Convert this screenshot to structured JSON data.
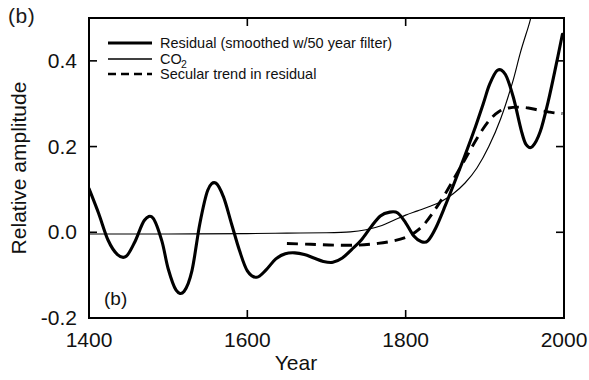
{
  "figure": {
    "panel_label_outer": "(b)",
    "panel_label_inner": "(b)"
  },
  "legend": {
    "position": "top-left-inside",
    "entries": [
      {
        "label": "Residual (smoothed w/50 year filter)",
        "style": "thick-solid",
        "name": "residual"
      },
      {
        "label": "CO",
        "sublabel": "2",
        "style": "thin-solid",
        "name": "co2"
      },
      {
        "label": "Secular trend in residual",
        "style": "dashed",
        "name": "secular-trend"
      }
    ]
  },
  "chart_data": {
    "type": "line",
    "title": "",
    "xlabel": "Year",
    "ylabel": "Relative amplitude",
    "xlim": [
      1400,
      2000
    ],
    "ylim": [
      -0.2,
      0.5
    ],
    "yaxis_display_range": [
      -0.2,
      0.5
    ],
    "xticks": [
      1400,
      1600,
      1800,
      2000
    ],
    "xtick_labels": [
      "1400",
      "1600",
      "1800",
      "2000"
    ],
    "yticks": [
      -0.2,
      0.0,
      0.2,
      0.4
    ],
    "ytick_labels": [
      "-0.2",
      "0.0",
      "0.2",
      "0.4"
    ],
    "grid": false,
    "legend_position": "upper left",
    "series": [
      {
        "name": "Residual (smoothed w/50 year filter)",
        "style": "thick-solid",
        "x": [
          1400,
          1412,
          1424,
          1436,
          1447,
          1458,
          1470,
          1481,
          1492,
          1500,
          1510,
          1520,
          1530,
          1540,
          1550,
          1560,
          1570,
          1580,
          1590,
          1600,
          1612,
          1624,
          1636,
          1648,
          1660,
          1672,
          1684,
          1696,
          1708,
          1720,
          1732,
          1744,
          1756,
          1768,
          1780,
          1790,
          1800,
          1810,
          1820,
          1828,
          1838,
          1850,
          1862,
          1874,
          1886,
          1898,
          1906,
          1916,
          1926,
          1936,
          1946,
          1952,
          1960,
          1970,
          1980,
          1990,
          1998
        ],
        "y": [
          0.102,
          0.045,
          -0.018,
          -0.052,
          -0.056,
          -0.022,
          0.028,
          0.033,
          -0.02,
          -0.085,
          -0.135,
          -0.138,
          -0.09,
          0.02,
          0.098,
          0.115,
          0.082,
          0.02,
          -0.042,
          -0.09,
          -0.105,
          -0.087,
          -0.062,
          -0.05,
          -0.048,
          -0.052,
          -0.06,
          -0.068,
          -0.07,
          -0.06,
          -0.04,
          -0.018,
          0.012,
          0.038,
          0.047,
          0.045,
          0.022,
          -0.008,
          -0.022,
          -0.02,
          0.01,
          0.062,
          0.118,
          0.175,
          0.235,
          0.3,
          0.345,
          0.378,
          0.368,
          0.315,
          0.238,
          0.205,
          0.2,
          0.235,
          0.305,
          0.39,
          0.462
        ]
      },
      {
        "name": "CO2",
        "style": "thin-solid",
        "x": [
          1400,
          1500,
          1600,
          1650,
          1700,
          1730,
          1750,
          1770,
          1785,
          1800,
          1815,
          1830,
          1845,
          1860,
          1875,
          1890,
          1905,
          1920,
          1935,
          1945,
          1955,
          1958
        ],
        "y": [
          -0.004,
          -0.004,
          -0.003,
          -0.002,
          -0.001,
          0.001,
          0.006,
          0.016,
          0.028,
          0.04,
          0.05,
          0.06,
          0.072,
          0.09,
          0.115,
          0.15,
          0.2,
          0.265,
          0.35,
          0.42,
          0.48,
          0.5
        ]
      },
      {
        "name": "Secular trend in residual",
        "style": "dashed",
        "x": [
          1650,
          1680,
          1710,
          1740,
          1765,
          1785,
          1800,
          1812,
          1824,
          1836,
          1850,
          1864,
          1878,
          1892,
          1906,
          1918,
          1930,
          1942,
          1955,
          1968,
          1980,
          1990,
          1998
        ],
        "y": [
          -0.026,
          -0.028,
          -0.03,
          -0.03,
          -0.026,
          -0.02,
          -0.012,
          0.0,
          0.02,
          0.05,
          0.09,
          0.135,
          0.18,
          0.225,
          0.262,
          0.282,
          0.29,
          0.292,
          0.29,
          0.285,
          0.281,
          0.278,
          0.277
        ]
      }
    ],
    "zero_line": {
      "value": 0.0,
      "present": true,
      "style": "thin-solid",
      "description": "CO2 baseline runs flat near zero before 1750"
    },
    "annotations": [
      {
        "text": "(b)",
        "location": "inside-lower-left"
      }
    ]
  }
}
